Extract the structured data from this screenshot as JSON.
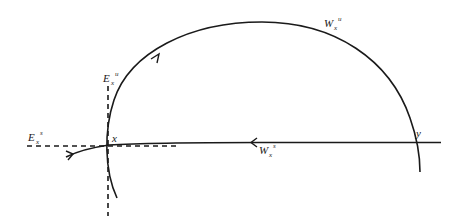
{
  "diagram": {
    "points": [
      {
        "id": "x",
        "label": "x"
      },
      {
        "id": "y",
        "label": "y"
      }
    ],
    "labels": {
      "unstable_manifold": {
        "base": "W",
        "sub": "x",
        "sup": "u"
      },
      "stable_manifold": {
        "base": "W",
        "sub": "x",
        "sup": "s"
      },
      "unstable_eigenspace": {
        "base": "E",
        "sub": "x",
        "sup": "u"
      },
      "stable_eigenspace": {
        "base": "E",
        "sub": "x",
        "sup": "s"
      }
    },
    "colors": {
      "stroke": "#1a1a1a",
      "background": "#ffffff"
    }
  }
}
